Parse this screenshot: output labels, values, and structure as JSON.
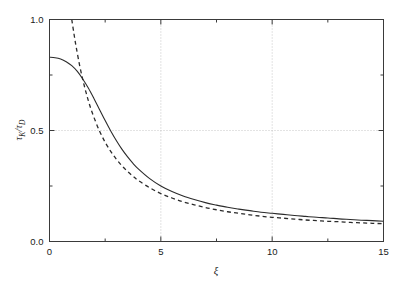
{
  "chart_data": {
    "type": "line",
    "title": "",
    "subtitle": "",
    "xlabel": "ξ",
    "ylabel": "τK / τD",
    "ylabel_parts": {
      "numerator_base": "τ",
      "numerator_sub": "K",
      "separator": "/",
      "denominator_base": "τ",
      "denominator_sub": "D"
    },
    "xlim": [
      0,
      15
    ],
    "ylim": [
      0.0,
      1.0
    ],
    "x_major_ticks": [
      0,
      5,
      10,
      15
    ],
    "x_major_tick_labels": [
      "0",
      "5",
      "10",
      "15"
    ],
    "x_minor_ticks": [
      2.5,
      7.5,
      12.5
    ],
    "y_major_ticks": [
      0.0,
      0.5,
      1.0
    ],
    "y_major_tick_labels": [
      "0.0",
      "0.5",
      "1.0"
    ],
    "y_minor_ticks": [
      0.25,
      0.75
    ],
    "grid": true,
    "grid_style": "dotted",
    "grid_color": "#b8b8b8",
    "grid_x_values": [
      5,
      10
    ],
    "grid_y_values": [
      0.5
    ],
    "axis_color": "#3a3a3a",
    "legend": "none",
    "tick_direction": "in",
    "frame": "box",
    "series": [
      {
        "name": "solid",
        "style": "solid",
        "color": "#2b2b2b",
        "x": [
          0.0,
          0.25,
          0.5,
          0.75,
          1.0,
          1.25,
          1.5,
          1.75,
          2.0,
          2.25,
          2.5,
          2.75,
          3.0,
          3.25,
          3.5,
          3.75,
          4.0,
          4.5,
          5.0,
          5.5,
          6.0,
          6.5,
          7.0,
          7.5,
          8.0,
          8.5,
          9.0,
          9.5,
          10.0,
          10.5,
          11.0,
          11.5,
          12.0,
          12.5,
          13.0,
          13.5,
          14.0,
          14.5,
          15.0
        ],
        "y": [
          0.83,
          0.828,
          0.822,
          0.81,
          0.792,
          0.766,
          0.731,
          0.69,
          0.643,
          0.594,
          0.545,
          0.498,
          0.455,
          0.416,
          0.382,
          0.352,
          0.326,
          0.283,
          0.25,
          0.225,
          0.205,
          0.189,
          0.175,
          0.164,
          0.154,
          0.146,
          0.139,
          0.132,
          0.127,
          0.122,
          0.117,
          0.113,
          0.109,
          0.106,
          0.102,
          0.099,
          0.096,
          0.094,
          0.091
        ]
      },
      {
        "name": "dashed",
        "style": "dashed",
        "color": "#2b2b2b",
        "x": [
          1.0,
          1.1,
          1.2,
          1.35,
          1.5,
          1.65,
          1.8,
          2.0,
          2.25,
          2.5,
          2.75,
          3.0,
          3.25,
          3.5,
          3.75,
          4.0,
          4.5,
          5.0,
          5.5,
          6.0,
          6.5,
          7.0,
          7.5,
          8.0,
          8.5,
          9.0,
          9.5,
          10.0,
          10.5,
          11.0,
          11.5,
          12.0,
          12.5,
          13.0,
          13.5,
          14.0,
          14.5,
          15.0
        ],
        "y": [
          1.0,
          0.935,
          0.875,
          0.795,
          0.727,
          0.668,
          0.616,
          0.558,
          0.497,
          0.447,
          0.406,
          0.371,
          0.341,
          0.316,
          0.294,
          0.274,
          0.242,
          0.216,
          0.196,
          0.179,
          0.165,
          0.153,
          0.143,
          0.134,
          0.127,
          0.12,
          0.114,
          0.109,
          0.105,
          0.101,
          0.097,
          0.094,
          0.091,
          0.089,
          0.086,
          0.084,
          0.082,
          0.08
        ]
      }
    ]
  }
}
